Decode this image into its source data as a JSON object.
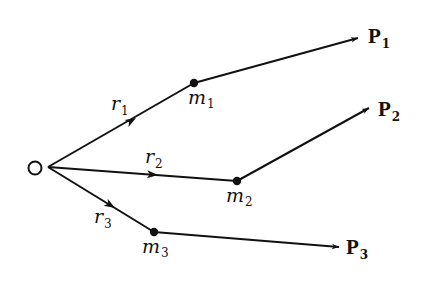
{
  "diagram": {
    "origin": {
      "label": "O",
      "x": 35,
      "y": 168,
      "vertex_x": 48,
      "vertex_y": 167
    },
    "colors": {
      "stroke": "#111111",
      "background": "#ffffff"
    },
    "masses": [
      {
        "id": "m1",
        "label": "m",
        "sub": "1",
        "x": 194,
        "y": 83
      },
      {
        "id": "m2",
        "label": "m",
        "sub": "2",
        "x": 237,
        "y": 181
      },
      {
        "id": "m3",
        "label": "m",
        "sub": "3",
        "x": 154,
        "y": 232
      }
    ],
    "position_vectors": [
      {
        "id": "r1",
        "label": "r",
        "sub": "1",
        "from": "O",
        "to": "m1"
      },
      {
        "id": "r2",
        "label": "r",
        "sub": "2",
        "from": "O",
        "to": "m2"
      },
      {
        "id": "r3",
        "label": "r",
        "sub": "3",
        "from": "O",
        "to": "m3"
      }
    ],
    "momentum_vectors": [
      {
        "id": "P1",
        "label": "P",
        "sub": "1",
        "from": "m1",
        "tip_x": 358,
        "tip_y": 38
      },
      {
        "id": "P2",
        "label": "P",
        "sub": "2",
        "from": "m2",
        "tip_x": 369,
        "tip_y": 108
      },
      {
        "id": "P3",
        "label": "P",
        "sub": "3",
        "from": "m3",
        "tip_x": 339,
        "tip_y": 247
      }
    ]
  },
  "labels": {
    "O": "O",
    "r1": "r",
    "r1_sub": "1",
    "r2": "r",
    "r2_sub": "2",
    "r3": "r",
    "r3_sub": "3",
    "m1": "m",
    "m1_sub": "1",
    "m2": "m",
    "m2_sub": "2",
    "m3": "m",
    "m3_sub": "3",
    "P1": "P",
    "P1_sub": "1",
    "P2": "P",
    "P2_sub": "2",
    "P3": "P",
    "P3_sub": "3"
  }
}
